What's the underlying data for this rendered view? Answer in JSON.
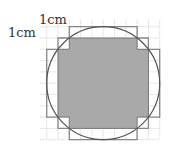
{
  "labels": {
    "horizontal_unit": "1cm",
    "vertical_unit": "1cm"
  },
  "grid": {
    "origin_x": 46.7,
    "origin_y": 26.7,
    "cell": 11.3,
    "cols": 10,
    "rows": 10,
    "line_color": "#c8c8c8"
  },
  "circle": {
    "radius_cells": 5,
    "stroke": "#555555"
  },
  "shaded_region": {
    "fill": "#a9a9a9",
    "description": "squares fully inside circle"
  },
  "outer_outline": {
    "stroke": "#888888",
    "description": "squares touching circle"
  }
}
